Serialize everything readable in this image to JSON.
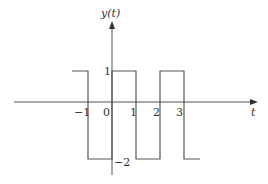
{
  "diagram": {
    "type": "signal-plot",
    "y_axis_label": "y(t)",
    "x_axis_label": "t",
    "x_ticks": [
      "-1",
      "0",
      "1",
      "2",
      "3"
    ],
    "y_ticks": [
      "1",
      "-2"
    ],
    "signal": {
      "description": "Periodic rectangular wave",
      "high_value": 1,
      "low_value": -2,
      "segments": [
        {
          "t_start": -1.7,
          "t_end": -1,
          "value": 1
        },
        {
          "t_start": -1,
          "t_end": 0,
          "value": -2
        },
        {
          "t_start": 0,
          "t_end": 1,
          "value": 1
        },
        {
          "t_start": 1,
          "t_end": 2,
          "value": -2
        },
        {
          "t_start": 2,
          "t_end": 3,
          "value": 1
        },
        {
          "t_start": 3,
          "t_end": 3.7,
          "value": -2
        }
      ]
    },
    "colors": {
      "line": "#555555",
      "text": "#333333"
    }
  },
  "labels": {
    "y_axis": "y(t)",
    "x_axis": "t",
    "tick_neg1": "−1",
    "tick_0": "0",
    "tick_1": "1",
    "tick_2": "2",
    "tick_3": "3",
    "level_high": "1",
    "level_low": "−2"
  }
}
